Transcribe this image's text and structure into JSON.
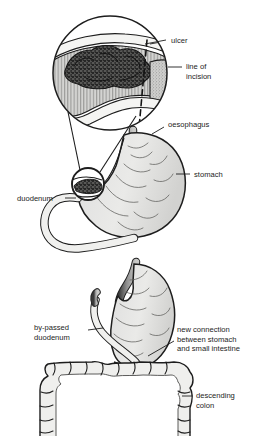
{
  "figure": {
    "title_fragment": "",
    "background_color": "#ffffff",
    "ink_color": "#1d1d1d",
    "organ_fill": "#e8e8e6",
    "ulcer_fill": "#4a4a4a",
    "oesophagus_fill": "#8c8c8c",
    "panels": [
      {
        "id": "panel-inset",
        "name": "magnified-ulcer-inset",
        "description": "circular magnified view of stomach wall with ulcer and dashed line of incision"
      },
      {
        "id": "panel-before",
        "name": "stomach-before-surgery",
        "description": "stomach with oesophagus and duodenum, ulcer circled at pylorus"
      },
      {
        "id": "panel-after",
        "name": "stomach-after-surgery",
        "description": "post-operative stomach joined to small intestine, by-passed duodenum, descending colon"
      }
    ],
    "labels": [
      {
        "id": "ulcer",
        "text": "ulcer",
        "lines": [
          "ulcer"
        ],
        "panel": "panel-inset",
        "x": 171,
        "y": 40
      },
      {
        "id": "line-of-incision",
        "text": "line of incision",
        "lines": [
          "line of",
          "incision"
        ],
        "panel": "panel-inset",
        "x": 186,
        "y": 67
      },
      {
        "id": "oesophagus",
        "text": "oesophagus",
        "lines": [
          "oesophagus"
        ],
        "panel": "panel-before",
        "x": 168,
        "y": 124
      },
      {
        "id": "stomach",
        "text": "stomach",
        "lines": [
          "stomach"
        ],
        "panel": "panel-before",
        "x": 194,
        "y": 176
      },
      {
        "id": "duodenum",
        "text": "duodenum",
        "lines": [
          "duodenum"
        ],
        "panel": "panel-before",
        "x": 17,
        "y": 200
      },
      {
        "id": "by-passed-duodenum",
        "text": "by-passed duodenum",
        "lines": [
          "by-passed",
          "duodenum"
        ],
        "panel": "panel-after",
        "x": 34,
        "y": 330
      },
      {
        "id": "new-connection",
        "text": "new connection between stomach and small intestine",
        "lines": [
          "new connection",
          "between stomach",
          "and small intestine"
        ],
        "panel": "panel-after",
        "x": 177,
        "y": 331
      },
      {
        "id": "descending-colon",
        "text": "descending colon",
        "lines": [
          "descending",
          "colon"
        ],
        "panel": "panel-after",
        "x": 196,
        "y": 396
      }
    ]
  }
}
